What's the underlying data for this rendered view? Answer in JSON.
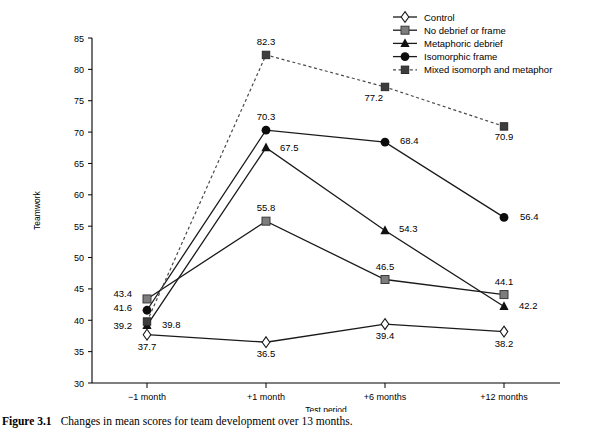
{
  "figure": {
    "caption_label": "Figure 3.1",
    "caption_text": "Changes in mean scores for team development over 13 months."
  },
  "axes": {
    "ylabel": "Teamwork",
    "xlabel": "Test period",
    "yticks": [
      "30",
      "35",
      "40",
      "45",
      "50",
      "55",
      "60",
      "65",
      "70",
      "75",
      "80",
      "85"
    ],
    "xticks": [
      "−1 month",
      "+1 month",
      "+6 months",
      "+12 months"
    ]
  },
  "legend": {
    "items": [
      {
        "label": "Control",
        "marker": "diamond-open",
        "style": "solid"
      },
      {
        "label": "No debrief or frame",
        "marker": "square-gray",
        "style": "solid"
      },
      {
        "label": "Metaphoric debrief",
        "marker": "triangle-filled",
        "style": "solid"
      },
      {
        "label": "Isomorphic frame",
        "marker": "circle-filled",
        "style": "solid"
      },
      {
        "label": "Mixed isomorph and metaphor",
        "marker": "square-dark",
        "style": "dashed"
      }
    ]
  },
  "chart_data": {
    "type": "line",
    "title": "",
    "xlabel": "Test period",
    "ylabel": "Teamwork",
    "ylim": [
      30,
      85
    ],
    "ytick_step": 5,
    "grid": false,
    "legend_position": "top-right",
    "categories": [
      "−1 month",
      "+1 month",
      "+6 months",
      "+12 months"
    ],
    "series": [
      {
        "name": "Control",
        "marker": "diamond-open",
        "linestyle": "solid",
        "values": [
          37.7,
          36.5,
          39.4,
          38.2
        ],
        "labels": [
          "37.7",
          "36.5",
          "39.4",
          "38.2"
        ]
      },
      {
        "name": "No debrief or frame",
        "marker": "square-gray",
        "linestyle": "solid",
        "values": [
          43.4,
          55.8,
          46.5,
          44.1
        ],
        "labels": [
          "43.4",
          "55.8",
          "46.5",
          "44.1"
        ]
      },
      {
        "name": "Metaphoric debrief",
        "marker": "triangle-filled",
        "linestyle": "solid",
        "values": [
          39.2,
          67.5,
          54.3,
          42.2
        ],
        "labels": [
          "39.2",
          "67.5",
          "54.3",
          "42.2"
        ]
      },
      {
        "name": "Isomorphic frame",
        "marker": "circle-filled",
        "linestyle": "solid",
        "values": [
          41.6,
          70.3,
          68.4,
          56.4
        ],
        "labels": [
          "41.6",
          "70.3",
          "68.4",
          "56.4"
        ]
      },
      {
        "name": "Mixed isomorph and metaphor",
        "marker": "square-dark",
        "linestyle": "dashed",
        "values": [
          39.8,
          82.3,
          77.2,
          70.9
        ],
        "labels": [
          "39.8",
          "82.3",
          "77.2",
          "70.9"
        ]
      }
    ]
  },
  "datalabel_offsets": {
    "Control": [
      [
        0,
        15
      ],
      [
        0,
        15
      ],
      [
        0,
        15
      ],
      [
        0,
        15
      ]
    ],
    "No debrief or frame": [
      [
        -15,
        -2
      ],
      [
        0,
        -10
      ],
      [
        0,
        -10
      ],
      [
        0,
        -10
      ]
    ],
    "Metaphoric debrief": [
      [
        -15,
        4
      ],
      [
        14,
        3
      ],
      [
        14,
        1
      ],
      [
        15,
        3
      ]
    ],
    "Isomorphic frame": [
      [
        -15,
        1
      ],
      [
        0,
        -10
      ],
      [
        15,
        2
      ],
      [
        16,
        3
      ]
    ],
    "Mixed isomorph and metaphor": [
      [
        15,
        6
      ],
      [
        0,
        -10
      ],
      [
        -2,
        14
      ],
      [
        0,
        14
      ]
    ]
  }
}
